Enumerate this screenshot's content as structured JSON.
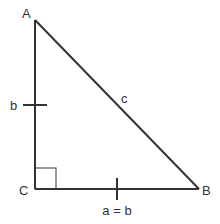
{
  "diagram": {
    "type": "right-triangle",
    "colors": {
      "stroke": "#333333",
      "label": "#333333",
      "background": "#ffffff"
    },
    "vertices": {
      "A": {
        "label": "A",
        "x": 35,
        "y": 20
      },
      "B": {
        "label": "B",
        "x": 199,
        "y": 189
      },
      "C": {
        "label": "C",
        "x": 35,
        "y": 189
      }
    },
    "sides": {
      "AC": {
        "label": "b"
      },
      "AB": {
        "label": "c"
      },
      "CB": {
        "label": "a = b"
      }
    },
    "right_angle_at": "C",
    "tick_marks": [
      "AC",
      "CB"
    ]
  }
}
